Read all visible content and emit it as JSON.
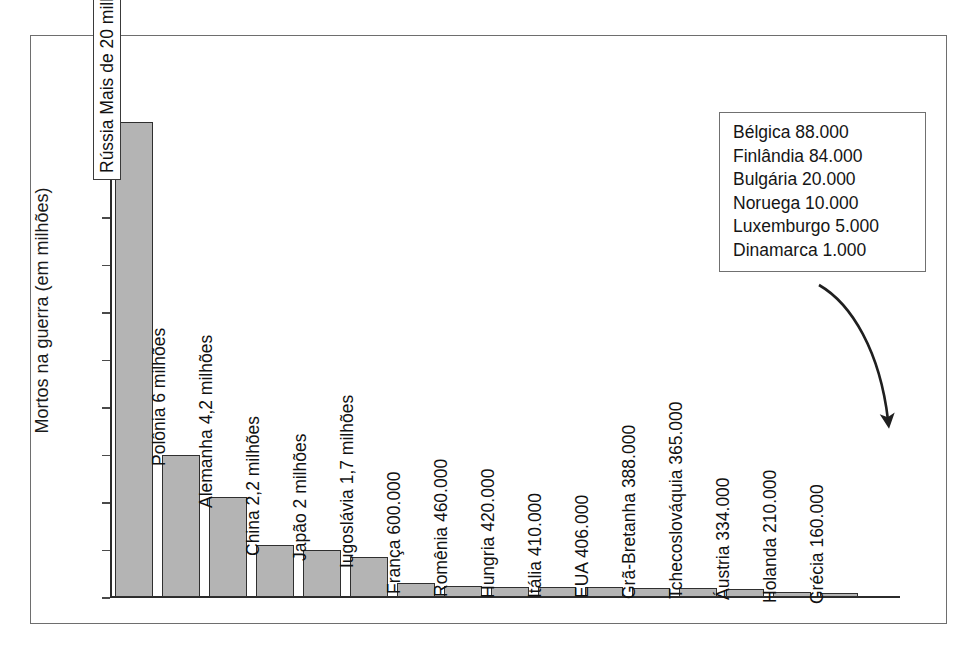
{
  "chart_data": {
    "type": "bar",
    "title": "",
    "xlabel": "",
    "ylabel": "Mortos na guerra (em milhões)",
    "ylim": [
      0,
      20
    ],
    "yticks": [
      20,
      18,
      16,
      14,
      12,
      10,
      8,
      6,
      4,
      2,
      0
    ],
    "grid": false,
    "legend_position": "top-right-box",
    "categories": [
      "Rússia",
      "Polônia",
      "Alemanha",
      "China",
      "Japão",
      "Iugoslávia",
      "França",
      "Romênia",
      "Hungria",
      "Itália",
      "EUA",
      "Grã-Bretanha",
      "Tchecoslováquia",
      "Áustria",
      "Holanda",
      "Grécia"
    ],
    "values": [
      20,
      6,
      4.2,
      2.2,
      2,
      1.7,
      0.6,
      0.46,
      0.42,
      0.41,
      0.406,
      0.388,
      0.365,
      0.334,
      0.21,
      0.16
    ],
    "bars": [
      {
        "label": "Rússia Mais de 20 milhões",
        "value": 20,
        "label_inside": true
      },
      {
        "label": "Polônia 6 milhões",
        "value": 6,
        "label_inside": false
      },
      {
        "label": "Alemanha 4,2 milhões",
        "value": 4.2,
        "label_inside": false
      },
      {
        "label": "China 2,2 milhões",
        "value": 2.2,
        "label_inside": false
      },
      {
        "label": "Japão 2 milhões",
        "value": 2,
        "label_inside": false
      },
      {
        "label": "Iugoslávia 1,7 milhões",
        "value": 1.7,
        "label_inside": false
      },
      {
        "label": "França 600.000",
        "value": 0.6,
        "label_inside": false
      },
      {
        "label": "Romênia 460.000",
        "value": 0.46,
        "label_inside": false
      },
      {
        "label": "Hungria 420.000",
        "value": 0.42,
        "label_inside": false
      },
      {
        "label": "Itália 410.000",
        "value": 0.41,
        "label_inside": false
      },
      {
        "label": "EUA 406.000",
        "value": 0.406,
        "label_inside": false
      },
      {
        "label": "Grã-Bretanha 388.000",
        "value": 0.388,
        "label_inside": false
      },
      {
        "label": "Tchecoslováquia 365.000",
        "value": 0.365,
        "label_inside": false
      },
      {
        "label": "Áustria 334.000",
        "value": 0.334,
        "label_inside": false
      },
      {
        "label": "Holanda 210.000",
        "value": 0.21,
        "label_inside": false
      },
      {
        "label": "Grécia 160.000",
        "value": 0.16,
        "label_inside": false
      }
    ],
    "annotations": {
      "note_box": [
        "Bélgica 88.000",
        "Finlândia 84.000",
        "Bulgária 20.000",
        "Noruega 10.000",
        "Luxemburgo 5.000",
        "Dinamarca 1.000"
      ],
      "arrow": "curved-arrow-from-note-box-to-smallest-bars"
    },
    "colors": {
      "bar_fill": "#b4b4b4",
      "bar_stroke": "#2f2f2f",
      "axis": "#2b2b2b",
      "frame": "#6e6e6e",
      "text": "#1a1a1a",
      "background": "#ffffff"
    }
  }
}
